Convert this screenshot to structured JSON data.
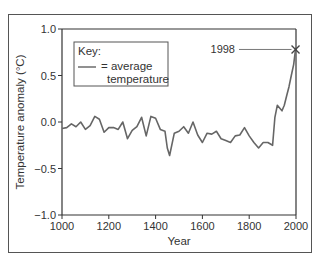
{
  "chart_data": {
    "type": "line",
    "title": "",
    "xlabel": "Year",
    "ylabel": "Temperature anomaly (°C)",
    "xlim": [
      1000,
      2000
    ],
    "ylim": [
      -1.0,
      1.0
    ],
    "x_ticks": [
      "1000",
      "1200",
      "1400",
      "1600",
      "1800",
      "2000"
    ],
    "y_ticks": [
      "1.0",
      "0.5",
      "0.0",
      "−0.5",
      "−1.0"
    ],
    "grid": false,
    "legend": {
      "title": "Key:",
      "entries": [
        {
          "label_line1": "= average",
          "label_line2": "temperature"
        }
      ],
      "position": "upper-left"
    },
    "annotations": [
      {
        "text": "1998",
        "x": 1998,
        "y": 0.78,
        "marker": "x"
      }
    ],
    "series": [
      {
        "name": "average temperature",
        "x": [
          1000,
          1020,
          1040,
          1060,
          1080,
          1100,
          1120,
          1140,
          1160,
          1180,
          1200,
          1220,
          1240,
          1260,
          1280,
          1300,
          1320,
          1340,
          1360,
          1380,
          1400,
          1420,
          1440,
          1450,
          1460,
          1480,
          1500,
          1520,
          1540,
          1560,
          1580,
          1600,
          1620,
          1640,
          1660,
          1680,
          1700,
          1720,
          1740,
          1760,
          1780,
          1800,
          1820,
          1840,
          1860,
          1880,
          1900,
          1910,
          1920,
          1940,
          1950,
          1960,
          1970,
          1980,
          1990,
          1998,
          2000
        ],
        "values": [
          -0.07,
          -0.06,
          -0.02,
          -0.05,
          0.0,
          -0.08,
          -0.04,
          0.06,
          0.03,
          -0.11,
          -0.06,
          -0.06,
          -0.08,
          0.0,
          -0.18,
          -0.09,
          -0.05,
          0.05,
          -0.15,
          0.06,
          0.04,
          -0.08,
          -0.1,
          -0.28,
          -0.36,
          -0.12,
          -0.1,
          -0.05,
          -0.12,
          0.0,
          -0.14,
          -0.22,
          -0.12,
          -0.13,
          -0.1,
          -0.18,
          -0.2,
          -0.22,
          -0.15,
          -0.14,
          -0.06,
          -0.15,
          -0.22,
          -0.28,
          -0.22,
          -0.22,
          -0.25,
          0.05,
          0.18,
          0.12,
          0.18,
          0.28,
          0.38,
          0.5,
          0.62,
          0.78,
          0.8
        ]
      }
    ]
  }
}
